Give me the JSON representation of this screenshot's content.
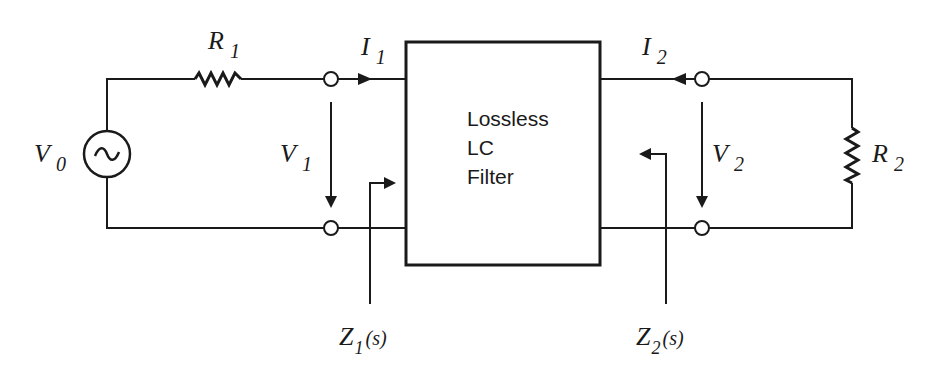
{
  "diagram": {
    "type": "two-port network",
    "filter_box": {
      "lines": [
        "Lossless",
        "LC",
        "Filter"
      ]
    },
    "source": {
      "symbol": "V",
      "subscript": "0",
      "glyph": "~"
    },
    "resistor_1": {
      "symbol": "R",
      "subscript": "1"
    },
    "resistor_2": {
      "symbol": "R",
      "subscript": "2"
    },
    "current_1": {
      "symbol": "I",
      "subscript": "1"
    },
    "current_2": {
      "symbol": "I",
      "subscript": "2"
    },
    "voltage_1": {
      "symbol": "V",
      "subscript": "1"
    },
    "voltage_2": {
      "symbol": "V",
      "subscript": "2"
    },
    "impedance_1": {
      "symbol": "Z",
      "subscript": "1",
      "arg": "(s)"
    },
    "impedance_2": {
      "symbol": "Z",
      "subscript": "2",
      "arg": "(s)"
    },
    "colors": {
      "line": "#1a1a1a",
      "background": "#ffffff"
    }
  }
}
